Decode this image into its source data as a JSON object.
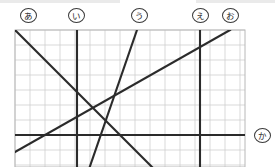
{
  "figure": {
    "background_color": "#ffffff",
    "grid": {
      "cell_size": 15,
      "left": 15,
      "top": 30,
      "right": 245,
      "bottom": 182,
      "columns": 15,
      "rows": 10,
      "line_color": "#cfcfcf",
      "border_color": "#b8b8b8",
      "visible": true
    },
    "line_color": "#2b2b2b",
    "line_width": 2.1,
    "labels": [
      {
        "id": "a",
        "text": "あ",
        "x": 20,
        "y": 8,
        "target": "line-a"
      },
      {
        "id": "i",
        "text": "い",
        "x": 68,
        "y": 8,
        "target": "line-i"
      },
      {
        "id": "u",
        "text": "う",
        "x": 131,
        "y": 8,
        "target": "line-u"
      },
      {
        "id": "e",
        "text": "え",
        "x": 192,
        "y": 8,
        "target": "line-e"
      },
      {
        "id": "o",
        "text": "お",
        "x": 222,
        "y": 8,
        "target": "line-o"
      },
      {
        "id": "ka",
        "text": "か",
        "x": 254,
        "y": 128,
        "target": "line-ka"
      }
    ],
    "lines": [
      {
        "id": "line-a",
        "label": "あ",
        "orientation": "diagonal-down",
        "x1": 15,
        "y1": 30,
        "x2": 157,
        "y2": 172
      },
      {
        "id": "line-i",
        "label": "い",
        "orientation": "vertical",
        "x1": 77,
        "y1": 30,
        "x2": 77,
        "y2": 172
      },
      {
        "id": "line-u",
        "label": "う",
        "orientation": "diagonal-up",
        "x1": 137,
        "y1": 30,
        "x2": 88,
        "y2": 172
      },
      {
        "id": "line-e",
        "label": "え",
        "orientation": "vertical",
        "x1": 200,
        "y1": 30,
        "x2": 200,
        "y2": 172
      },
      {
        "id": "line-o",
        "label": "お",
        "orientation": "diagonal-up",
        "x1": 15,
        "y1": 152,
        "x2": 230,
        "y2": 30
      },
      {
        "id": "line-ka",
        "label": "か",
        "orientation": "horizontal",
        "x1": 15,
        "y1": 135,
        "x2": 245,
        "y2": 135
      }
    ],
    "intersections": [
      {
        "id": "node-upper",
        "x": 77,
        "y": 93,
        "lines": [
          "line-a",
          "line-i",
          "line-u"
        ]
      },
      {
        "id": "node-lower",
        "x": 125,
        "y": 135,
        "lines": [
          "line-a",
          "line-u",
          "line-ka"
        ]
      }
    ]
  }
}
